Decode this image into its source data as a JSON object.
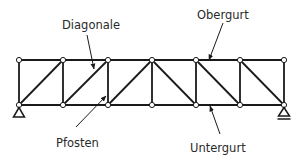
{
  "diagram": {
    "type": "parallel chord truss (Fachwerkträger)",
    "panels": 6,
    "colors": {
      "line": "#1a1a1a",
      "node_fill": "#ffffff",
      "text": "#2a2a2a",
      "background": "#ffffff"
    },
    "labels": [
      {
        "id": "diagonale",
        "text": "Diagonale",
        "x": 62,
        "y": 20
      },
      {
        "id": "obergurt",
        "text": "Obergurt",
        "x": 197,
        "y": 10
      },
      {
        "id": "pfosten",
        "text": "Pfosten",
        "x": 56,
        "y": 138
      },
      {
        "id": "untergurt",
        "text": "Untergurt",
        "x": 190,
        "y": 143
      }
    ],
    "nodes_x": [
      19,
      63,
      108,
      152,
      196,
      240,
      284
    ],
    "top_y": 60,
    "bottom_y": 105,
    "supports": [
      {
        "position": "left",
        "kind": "pinned"
      },
      {
        "position": "right",
        "kind": "roller"
      }
    ]
  }
}
